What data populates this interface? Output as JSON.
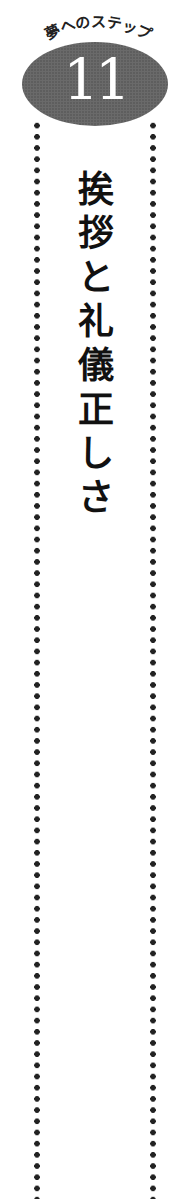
{
  "header": {
    "arc_label": "夢へのステップ",
    "step_number": "11"
  },
  "title": {
    "text": "挨拶と礼儀正しさ",
    "chars": [
      "挨",
      "拶",
      "と",
      "礼",
      "儀",
      "正",
      "し",
      "さ"
    ]
  },
  "colors": {
    "badge": "#6a6a6a",
    "dots": "#222222",
    "text": "#111111"
  }
}
